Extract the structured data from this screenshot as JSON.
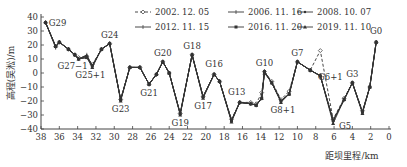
{
  "chart_data": {
    "type": "line",
    "title": "",
    "xlabel": "距坝里程/km",
    "ylabel": "高程(吴淞)/m",
    "xlim": [
      38,
      0
    ],
    "ylim": [
      -40,
      40
    ],
    "x_ticks": [
      38,
      36,
      34,
      32,
      30,
      28,
      26,
      24,
      22,
      20,
      18,
      16,
      14,
      12,
      10,
      8,
      6,
      4,
      2,
      0
    ],
    "y_ticks": [
      40,
      30,
      20,
      10,
      0,
      -10,
      -20,
      -30,
      -40
    ],
    "grid": false,
    "legend_position": "top",
    "x": [
      37.5,
      36.4,
      36.0,
      35.0,
      34.3,
      33.9,
      33.0,
      32.4,
      31.4,
      30.5,
      29.3,
      28.3,
      27.2,
      26.2,
      25.4,
      24.7,
      24.0,
      22.8,
      21.5,
      20.3,
      19.1,
      18.5,
      17.2,
      16.3,
      15.1,
      14.5,
      13.9,
      13.6,
      12.8,
      11.8,
      10.9,
      10.0,
      8.6,
      7.5,
      6.1,
      4.9,
      4.0,
      2.9,
      2.1,
      1.4
    ],
    "series": [
      {
        "name": "2002.12.05",
        "marker": "diamond-open",
        "dash": "dashed",
        "values": [
          36,
          19,
          22,
          17,
          13,
          11,
          12,
          6,
          17,
          21,
          -19,
          4,
          4,
          -8,
          -1,
          8,
          0,
          -29,
          13,
          -17,
          -1,
          -6,
          -33,
          -21,
          -21,
          -22,
          -14,
          1,
          -6,
          -19,
          -13,
          8,
          2,
          16,
          -33,
          -18,
          -7,
          -27,
          -10,
          22
        ]
      },
      {
        "name": "2006.11.16",
        "marker": "plus",
        "dash": "solid",
        "values": [
          36,
          18,
          22,
          17,
          13,
          10,
          12,
          5,
          17,
          21,
          -19,
          4,
          4,
          -8,
          -1,
          8,
          0,
          -29,
          13,
          -17,
          -1,
          -6,
          -34,
          -21,
          -22,
          -23,
          -18,
          1,
          -7,
          -20,
          -15,
          8,
          2,
          -2,
          -34,
          -19,
          -7,
          -28,
          -10,
          22
        ]
      },
      {
        "name": "2008.10.07",
        "marker": "dot",
        "dash": "solid",
        "values": [
          36,
          19,
          22,
          17,
          13,
          10,
          12,
          5,
          17,
          21,
          -19,
          4,
          4,
          -8,
          -1,
          8,
          0,
          -29,
          13,
          -17,
          -1,
          -6,
          -34,
          -21,
          -22,
          -23,
          -18,
          1,
          -7,
          -20,
          -15,
          8,
          2,
          -2,
          -34,
          -19,
          -7,
          -28,
          -10,
          22
        ]
      },
      {
        "name": "2012.11.15",
        "marker": "plus",
        "dash": "solid",
        "values": [
          36,
          19,
          22,
          17,
          13,
          10,
          13,
          5,
          17,
          21,
          -19,
          4,
          4,
          -8,
          -1,
          8,
          0,
          -29,
          13,
          -17,
          -1,
          -6,
          -34,
          -21,
          -22,
          -23,
          -18,
          1,
          -7,
          -20,
          -15,
          8,
          2,
          -2,
          -34,
          -19,
          -7,
          -28,
          -10,
          22
        ]
      },
      {
        "name": "2016.11.20",
        "marker": "square-filled",
        "dash": "solid",
        "values": [
          36,
          19,
          22,
          17,
          13,
          10,
          11,
          5,
          17,
          21,
          -19,
          4,
          4,
          -8,
          -1,
          8,
          0,
          -29,
          13,
          -17,
          -1,
          -6,
          -34,
          -21,
          -22,
          -23,
          -18,
          1,
          -7,
          -20,
          -15,
          8,
          2,
          -2,
          -34,
          -19,
          -7,
          -28,
          -10,
          22
        ]
      },
      {
        "name": "2019.11.10",
        "marker": "triangle-filled",
        "dash": "solid",
        "values": [
          36,
          19,
          22,
          17,
          13,
          10,
          11,
          4,
          17,
          21,
          -20,
          4,
          4,
          -8,
          -1,
          8,
          0,
          -30,
          13,
          -18,
          -1,
          -6,
          -35,
          -21,
          -22,
          -23,
          -18,
          0,
          -7,
          -21,
          -15,
          8,
          2,
          -2,
          -36,
          -19,
          -7,
          -29,
          -10,
          22
        ]
      }
    ],
    "annotations": [
      {
        "text": "G29",
        "x": 37.5,
        "y": 36
      },
      {
        "text": "G27−1",
        "x": 33.9,
        "y": 10
      },
      {
        "text": "G25+1",
        "x": 32.4,
        "y": 5
      },
      {
        "text": "G24",
        "x": 30.5,
        "y": 21
      },
      {
        "text": "G23",
        "x": 29.3,
        "y": -19
      },
      {
        "text": "G21",
        "x": 26.2,
        "y": -8
      },
      {
        "text": "G20",
        "x": 24.7,
        "y": 8
      },
      {
        "text": "G19",
        "x": 22.8,
        "y": -29
      },
      {
        "text": "G18",
        "x": 21.5,
        "y": 13
      },
      {
        "text": "G17",
        "x": 20.3,
        "y": -17
      },
      {
        "text": "G16",
        "x": 19.1,
        "y": -1
      },
      {
        "text": "G13",
        "x": 16.3,
        "y": -21
      },
      {
        "text": "G10",
        "x": 13.6,
        "y": 1
      },
      {
        "text": "G8+1",
        "x": 11.8,
        "y": -20
      },
      {
        "text": "G7",
        "x": 10.0,
        "y": 8
      },
      {
        "text": "G6+1",
        "x": 7.5,
        "y": -2
      },
      {
        "text": "G5",
        "x": 6.1,
        "y": -34
      },
      {
        "text": "G3",
        "x": 4.0,
        "y": -7
      },
      {
        "text": "G0",
        "x": 1.4,
        "y": 22
      }
    ]
  },
  "legend": [
    {
      "label": "2002. 12. 05"
    },
    {
      "label": "2006. 11. 16"
    },
    {
      "label": "2008. 10. 07"
    },
    {
      "label": "2012. 11. 15"
    },
    {
      "label": "2016. 11. 20"
    },
    {
      "label": "2019. 11. 10"
    }
  ],
  "axes": {
    "xlabel": "距坝里程/km",
    "ylabel": "高程(吴淞)/m"
  }
}
